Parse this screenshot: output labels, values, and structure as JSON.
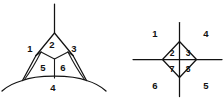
{
  "figure": {
    "background_color": "#ffffff",
    "stroke_color": "#121212",
    "label_color": "#111111",
    "panels": [
      {
        "name": "left-panel",
        "shape": "curvilinear-triangle-with-internal-y-junction",
        "description": "Three-armed curvilinear triangle whose arms extend up, lower-left and lower-right; an interior Y-junction subdivides the body into six regions.",
        "labels": [
          {
            "text": "1",
            "x": 30,
            "y": 49
          },
          {
            "text": "2",
            "x": 52,
            "y": 45
          },
          {
            "text": "3",
            "x": 74,
            "y": 49
          },
          {
            "text": "5",
            "x": 43,
            "y": 68
          },
          {
            "text": "6",
            "x": 63,
            "y": 68
          },
          {
            "text": "4",
            "x": 53,
            "y": 88
          }
        ]
      },
      {
        "name": "right-panel",
        "shape": "rhombus-with-crossing-axes",
        "description": "A rhombus crossed by a full vertical line and a full horizontal line, producing four inner quadrants and four outer sectors.",
        "labels": [
          {
            "text": "1",
            "x": 155,
            "y": 34
          },
          {
            "text": "4",
            "x": 206,
            "y": 34
          },
          {
            "text": "2",
            "x": 172,
            "y": 55
          },
          {
            "text": "3",
            "x": 187,
            "y": 55
          },
          {
            "text": "7",
            "x": 172,
            "y": 70
          },
          {
            "text": "8",
            "x": 187,
            "y": 70
          },
          {
            "text": "6",
            "x": 155,
            "y": 86
          },
          {
            "text": "5",
            "x": 206,
            "y": 86
          }
        ]
      }
    ]
  }
}
